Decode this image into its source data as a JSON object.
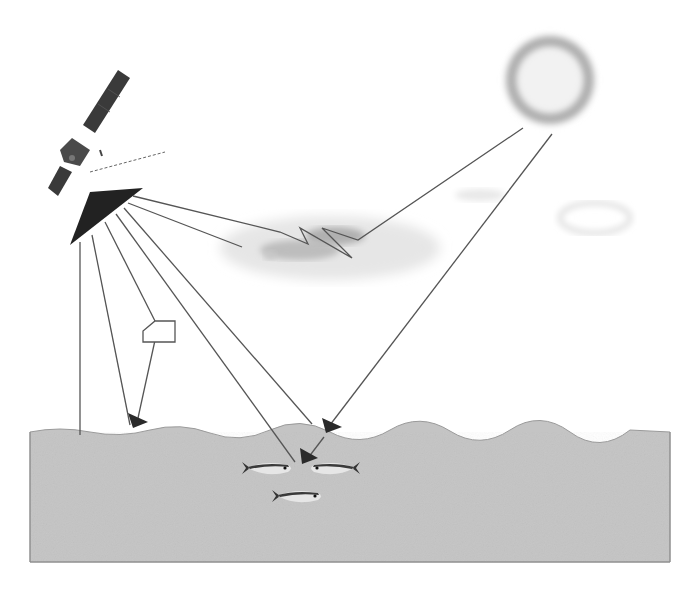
{
  "diagram": {
    "title": "",
    "colors": {
      "background": "#ffffff",
      "water": "#c4c4c4",
      "water_border": "#8a8a8a",
      "line": "#555555",
      "arrowhead": "#2a2a2a",
      "sensor": "#222222",
      "satellite": "#3a3a3a",
      "sun_core": "#f2f2f2",
      "sun_halo": "#9a9a9a",
      "cloud": "#d8d8d8",
      "cloud_dark": "#a8a8a8",
      "fish_back": "#3a3a3a",
      "fish_belly": "#e6e6e6"
    },
    "elements": {
      "satellite": {
        "label": ""
      },
      "sensor": {
        "label": ""
      },
      "sun": {
        "label": ""
      },
      "cloud": {
        "label": ""
      },
      "aerosol_particle": {
        "label": ""
      },
      "water_body": {
        "label": ""
      },
      "fish_school": {
        "count": 3,
        "label": ""
      }
    },
    "paths": [
      {
        "id": "sun-to-cloud-to-sensor",
        "kind": "atmospheric scattering (zigzag)"
      },
      {
        "id": "sun-to-surface",
        "kind": "direct sunlight to water surface"
      },
      {
        "id": "surface-to-fish",
        "kind": "subsurface penetration"
      },
      {
        "id": "sensor-nadir",
        "kind": "vertical ray to surface"
      },
      {
        "id": "sensor-via-particle",
        "kind": "aerosol scattering"
      },
      {
        "id": "sensor-to-fish",
        "kind": "water-leaving radiance"
      },
      {
        "id": "sensor-to-surface-glint",
        "kind": "surface reflection"
      },
      {
        "id": "sensor-to-cloud",
        "kind": "cloud view ray"
      }
    ]
  }
}
